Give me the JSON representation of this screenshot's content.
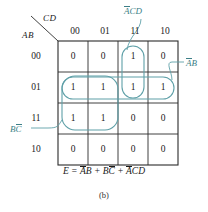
{
  "figure": {
    "caption": "(b)",
    "equation_prefix": "E  =  ",
    "equation_terms": [
      {
        "bar": "A",
        "plain": "B"
      },
      {
        "bar": "",
        "plain": "B",
        "bar2": "C"
      },
      {
        "bar": "A",
        "plain": "CD"
      }
    ],
    "equation_text": "E = ĀB + BC̄ + ĀCD"
  },
  "kmap": {
    "col_var": "CD",
    "row_var": "AB",
    "col_headers": [
      "00",
      "01",
      "11",
      "10"
    ],
    "row_headers": [
      "00",
      "01",
      "11",
      "10"
    ],
    "rows": [
      {
        "label": "00",
        "values": [
          "0",
          "0",
          "1",
          "0"
        ]
      },
      {
        "label": "01",
        "values": [
          "1",
          "1",
          "1",
          "1"
        ]
      },
      {
        "label": "11",
        "values": [
          "1",
          "1",
          "0",
          "0"
        ]
      },
      {
        "label": "10",
        "values": [
          "0",
          "0",
          "0",
          "0"
        ]
      }
    ]
  },
  "groups": [
    {
      "name": "acd",
      "label_bar": "A",
      "label_plain": "CD",
      "covers": "column 11, rows 00 and 01",
      "color": "#5fa0a8"
    },
    {
      "name": "ab",
      "label_bar": "A",
      "label_plain": "B",
      "covers": "row 01, all columns",
      "color": "#5fa0a8"
    },
    {
      "name": "bc",
      "label_bar": "",
      "label_plain": "B",
      "label_bar2": "C",
      "covers": "columns 00 and 01, rows 01 and 11",
      "color": "#5fa0a8"
    }
  ],
  "colors": {
    "grid": "#2b2b2b",
    "group": "#5fa0a8",
    "text": "#1a1a1a",
    "background": "#ffffff"
  }
}
